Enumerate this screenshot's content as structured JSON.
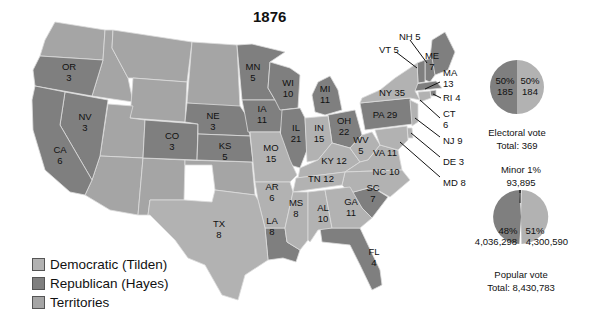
{
  "title": "1876",
  "colors": {
    "democratic": "#b2b2b2",
    "republican": "#7f7f7f",
    "territories": "#a5a5a5",
    "border": "#dcdcdc"
  },
  "legend": [
    {
      "label": "Democratic (Tilden)",
      "color": "#b2b2b2"
    },
    {
      "label": "Republican (Hayes)",
      "color": "#7f7f7f"
    },
    {
      "label": "Territories",
      "color": "#a5a5a5"
    }
  ],
  "states": {
    "OR": {
      "label": "OR",
      "votes": "3",
      "party": "republican"
    },
    "NV": {
      "label": "NV",
      "votes": "3",
      "party": "republican"
    },
    "CA": {
      "label": "CA",
      "votes": "6",
      "party": "republican"
    },
    "CO": {
      "label": "CO",
      "votes": "3",
      "party": "republican"
    },
    "NE": {
      "label": "NE",
      "votes": "3",
      "party": "republican"
    },
    "KS": {
      "label": "KS",
      "votes": "5",
      "party": "republican"
    },
    "MN": {
      "label": "MN",
      "votes": "5",
      "party": "republican"
    },
    "IA": {
      "label": "IA",
      "votes": "11",
      "party": "republican"
    },
    "WI": {
      "label": "WI",
      "votes": "10",
      "party": "republican"
    },
    "MI": {
      "label": "MI",
      "votes": "11",
      "party": "republican"
    },
    "IL": {
      "label": "IL",
      "votes": "21",
      "party": "republican"
    },
    "OH": {
      "label": "OH",
      "votes": "22",
      "party": "republican"
    },
    "PA": {
      "label": "PA 29",
      "votes": "",
      "party": "republican"
    },
    "MO": {
      "label": "MO",
      "votes": "15",
      "party": "democratic"
    },
    "IN": {
      "label": "IN",
      "votes": "15",
      "party": "democratic"
    },
    "KY": {
      "label": "KY 12",
      "votes": "",
      "party": "democratic"
    },
    "WV": {
      "label": "WV",
      "votes": "5",
      "party": "democratic"
    },
    "VA": {
      "label": "VA 11",
      "votes": "",
      "party": "democratic"
    },
    "NC": {
      "label": "NC 10",
      "votes": "",
      "party": "democratic"
    },
    "TN": {
      "label": "TN 12",
      "votes": "",
      "party": "democratic"
    },
    "AR": {
      "label": "AR",
      "votes": "6",
      "party": "democratic"
    },
    "LA": {
      "label": "LA",
      "votes": "8",
      "party": "republican"
    },
    "MS": {
      "label": "MS",
      "votes": "8",
      "party": "democratic"
    },
    "AL": {
      "label": "AL",
      "votes": "10",
      "party": "democratic"
    },
    "GA": {
      "label": "GA",
      "votes": "11",
      "party": "democratic"
    },
    "SC": {
      "label": "SC",
      "votes": "7",
      "party": "republican"
    },
    "FL": {
      "label": "FL",
      "votes": "4",
      "party": "republican"
    },
    "TX": {
      "label": "TX",
      "votes": "8",
      "party": "democratic"
    },
    "NY": {
      "label": "NY 35",
      "votes": "",
      "party": "democratic"
    },
    "ME": {
      "label": "ME",
      "votes": "7",
      "party": "republican"
    },
    "NH": {
      "label": "NH 5",
      "votes": "",
      "party": "republican"
    },
    "VT": {
      "label": "VT 5",
      "votes": "",
      "party": "republican"
    },
    "MA": {
      "label": "MA",
      "votes": "13",
      "party": "republican"
    },
    "RI": {
      "label": "RI 4",
      "votes": "",
      "party": "republican"
    },
    "CT": {
      "label": "CT",
      "votes": "6",
      "party": "democratic"
    },
    "NJ": {
      "label": "NJ 9",
      "votes": "",
      "party": "democratic"
    },
    "DE": {
      "label": "DE 3",
      "votes": "",
      "party": "democratic"
    },
    "MD": {
      "label": "MD 8",
      "votes": "",
      "party": "democratic"
    }
  },
  "electoral_pie": {
    "left_pct": "50%",
    "left_value": "185",
    "right_pct": "50%",
    "right_value": "184",
    "caption": "Electoral vote",
    "total": "Total: 369"
  },
  "popular_pie": {
    "minor_label": "Minor 1%",
    "minor_value": "93,895",
    "left_pct": "48%",
    "left_value": "4,036,298",
    "right_pct": "51%",
    "right_value": "4,300,590",
    "caption": "Popular vote",
    "total": "Total: 8,430,783"
  }
}
